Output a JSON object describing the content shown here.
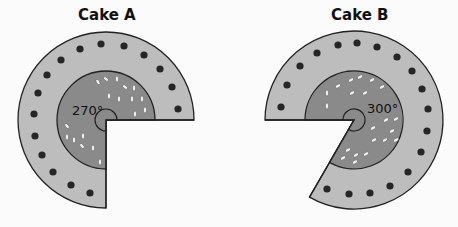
{
  "colors": {
    "background": "#fbfbfb",
    "outer_ring": "#bdbdbd",
    "inner_disc": "#8a8a8a",
    "dots": "#262626",
    "sprinkles": "#f0f0f0",
    "outline": "#222222"
  },
  "cakes": [
    {
      "title": "Cake A",
      "angle_label": "270°",
      "angle_deg": 270,
      "center": [
        106,
        120
      ],
      "outer_radius": 88,
      "inner_radius": 49,
      "hole_radius": 11,
      "missing_sector": "bottom-right 90°"
    },
    {
      "title": "Cake B",
      "angle_label": "300°",
      "angle_deg": 300,
      "center": [
        354,
        120
      ],
      "outer_radius": 89,
      "inner_radius": 49,
      "hole_radius": 11,
      "missing_sector": "lower-left 60°"
    }
  ]
}
